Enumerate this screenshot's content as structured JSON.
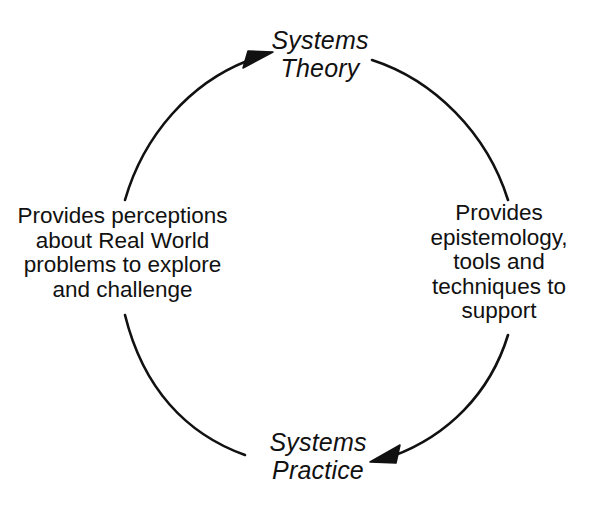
{
  "diagram": {
    "background_color": "#ffffff",
    "stroke_color": "#111111",
    "nodes": [
      {
        "id": "systems-theory",
        "label": "Systems\nTheory",
        "position": "top"
      },
      {
        "id": "systems-practice",
        "label": "Systems\nPractice",
        "position": "bottom"
      }
    ],
    "edges": [
      {
        "id": "theory-to-practice",
        "side": "right",
        "from": "systems-theory",
        "to": "systems-practice",
        "label": "Provides\nepistemology,\ntools and\ntechniques to\nsupport",
        "arrowhead": "at-systems-practice"
      },
      {
        "id": "practice-to-theory",
        "side": "left",
        "from": "systems-practice",
        "to": "systems-theory",
        "label": "Provides perceptions\nabout Real World\nproblems to explore\nand challenge",
        "arrowhead": "at-systems-theory"
      }
    ]
  }
}
